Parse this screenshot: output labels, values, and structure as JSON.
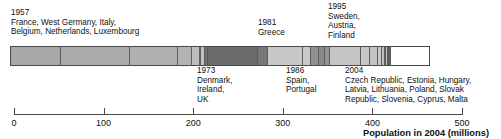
{
  "chart_data": {
    "type": "bar",
    "orientation": "horizontal-stacked",
    "title": "",
    "xlabel": "Population in 2004 (millions)",
    "ylabel": "",
    "xlim": [
      0,
      500
    ],
    "grid": false,
    "legend_position": "none",
    "xticks": [
      0,
      100,
      200,
      300,
      400,
      500
    ],
    "xticklabels": [
      "0",
      "100",
      "200",
      "300",
      "400",
      "500"
    ],
    "note": "Stacked horizontal bar: cumulative EU population in 2004 (millions), segments = member states grouped and shaded by accession year.",
    "groups": [
      {
        "year": "1957",
        "countries": "France, West Germany, Italy, Belgium, Netherlands, Luxembourg",
        "shade": "#a8a8a8",
        "start": 0,
        "end": 233,
        "total": 233
      },
      {
        "year": "1973",
        "countries": "Denmark, Ireland, UK",
        "shade": "#6d6d6d",
        "start": 233,
        "end": 300,
        "total": 67
      },
      {
        "year": "1981",
        "countries": "Greece",
        "shade": "#6d6d6d",
        "start": 300,
        "end": 311,
        "total": 11
      },
      {
        "year": "1986",
        "countries": "Spain, Portugal",
        "shade": "#c6c6c6",
        "start": 311,
        "end": 363,
        "total": 52
      },
      {
        "year": "1995",
        "countries": "Sweden, Austria, Finland",
        "shade": "#8f8f8f",
        "start": 363,
        "end": 384,
        "total": 21
      },
      {
        "year": "2004",
        "countries": "Czech Republic, Estonia, Hungary, Latvia, Lithuania, Poland, Slovak Republic, Slovenia, Cyprus, Malta",
        "shade": "#c6c6c6",
        "start": 384,
        "end": 459,
        "total": 75
      }
    ],
    "segments": [
      {
        "label": "France",
        "value": 60,
        "x0": 0,
        "x1": 60,
        "color": "#a8a8a8"
      },
      {
        "label": "West Germany",
        "value": 82,
        "x0": 60,
        "x1": 142,
        "color": "#ababab"
      },
      {
        "label": "Italy",
        "value": 58,
        "x0": 142,
        "x1": 200,
        "color": "#b0b0b0"
      },
      {
        "label": "Netherlands",
        "value": 16,
        "x0": 200,
        "x1": 216,
        "color": "#b4b4b4"
      },
      {
        "label": "Belgium",
        "value": 10,
        "x0": 216,
        "x1": 226,
        "color": "#bdbdbd"
      },
      {
        "label": "Luxembourg",
        "value": 1,
        "x0": 226,
        "x1": 227,
        "color": "#c0c0c0"
      },
      {
        "label": "Denmark",
        "value": 5,
        "x0": 227,
        "x1": 232,
        "color": "#c2c2c2"
      },
      {
        "label": "Ireland",
        "value": 4,
        "x0": 232,
        "x1": 236,
        "color": "#707070"
      },
      {
        "label": "UK",
        "value": 60,
        "x0": 236,
        "x1": 296,
        "color": "#6a6a6a"
      },
      {
        "label": "Greece",
        "value": 11,
        "x0": 296,
        "x1": 307,
        "color": "#777777"
      },
      {
        "label": "Spain",
        "value": 42,
        "x0": 307,
        "x1": 349,
        "color": "#c8c8c8"
      },
      {
        "label": "Portugal",
        "value": 10,
        "x0": 349,
        "x1": 359,
        "color": "#cacaca"
      },
      {
        "label": "Sweden",
        "value": 9,
        "x0": 359,
        "x1": 368,
        "color": "#909090"
      },
      {
        "label": "Austria",
        "value": 8,
        "x0": 368,
        "x1": 376,
        "color": "#8a8a8a"
      },
      {
        "label": "Finland",
        "value": 5,
        "x0": 376,
        "x1": 381,
        "color": "#949494"
      },
      {
        "label": "Poland",
        "value": 38,
        "x0": 381,
        "x1": 419,
        "color": "#c5c5c5"
      },
      {
        "label": "Czech Republic",
        "value": 10,
        "x0": 419,
        "x1": 429,
        "color": "#c7c7c7"
      },
      {
        "label": "Hungary",
        "value": 10,
        "x0": 429,
        "x1": 439,
        "color": "#c4c4c4"
      },
      {
        "label": "Slovak Republic",
        "value": 5,
        "x0": 439,
        "x1": 444,
        "color": "#c9c9c9"
      },
      {
        "label": "Lithuania",
        "value": 3,
        "x0": 444,
        "x1": 447,
        "color": "#bfbfbf"
      },
      {
        "label": "Latvia",
        "value": 2,
        "x0": 447,
        "x1": 449,
        "color": "#c6c6c6"
      },
      {
        "label": "Slovenia",
        "value": 2,
        "x0": 449,
        "x1": 451,
        "color": "#c2c2c2"
      },
      {
        "label": "Estonia",
        "value": 1,
        "x0": 451,
        "x1": 452,
        "color": "#c8c8c8"
      },
      {
        "label": "Cyprus",
        "value": 1,
        "x0": 452,
        "x1": 453,
        "color": "#c4c4c4"
      },
      {
        "label": "Malta",
        "value": 1,
        "x0": 453,
        "x1": 454,
        "color": "#c0c0c0"
      }
    ]
  },
  "annotations": {
    "a1957": "1957\nFrance, West Germany, Italy,\nBelgium, Netherlands, Luxembourg",
    "a1981": "1981\nGreece",
    "a1995": "1995\nSweden,\nAustria,\nFinland",
    "a1973": "1973\nDenmark,\nIreland,\nUK",
    "a1986": "1986\nSpain,\nPortugal",
    "a2004": "2004\nCzech Republic, Estonia, Hungary,\nLatvia, Lithuania, Poland, Slovak\nRepublic, Slovenia, Cyprus, Malta"
  },
  "axis": {
    "title": "Population in 2004 (millions)",
    "labels": [
      "0",
      "100",
      "200",
      "300",
      "400",
      "500"
    ]
  },
  "colors": {
    "bar_outline": "#4a4a4a",
    "axis": "#4a4a4a",
    "text": "#101010",
    "background": "#ffffff"
  }
}
